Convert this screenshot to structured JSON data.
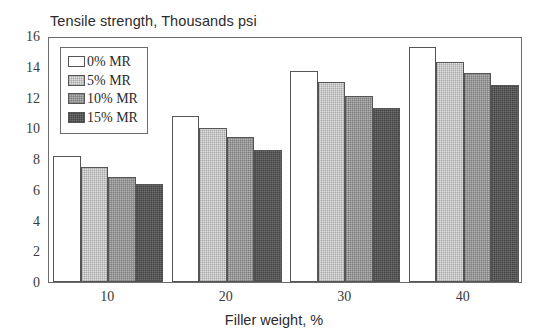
{
  "chart_data": {
    "type": "bar",
    "title": "Tensile strength, Thousands psi",
    "xlabel": "Filler weight, %",
    "ylabel": "",
    "categories": [
      "10",
      "20",
      "30",
      "40"
    ],
    "series": [
      {
        "name": "0% MR",
        "values": [
          8.2,
          10.8,
          13.7,
          15.3
        ],
        "color": "#ffffff"
      },
      {
        "name": "5% MR",
        "values": [
          7.5,
          10.0,
          13.0,
          14.3
        ],
        "color": "#e2e2e2"
      },
      {
        "name": "10% MR",
        "values": [
          6.8,
          9.4,
          12.1,
          13.6
        ],
        "color": "#b4b4b4"
      },
      {
        "name": "15% MR",
        "values": [
          6.4,
          8.6,
          11.3,
          12.8
        ],
        "color": "#6f6f6f"
      }
    ],
    "ylim": [
      0,
      16
    ],
    "yticks": [
      0,
      2,
      4,
      6,
      8,
      10,
      12,
      14,
      16
    ],
    "grid": false,
    "legend_position": "upper left"
  }
}
